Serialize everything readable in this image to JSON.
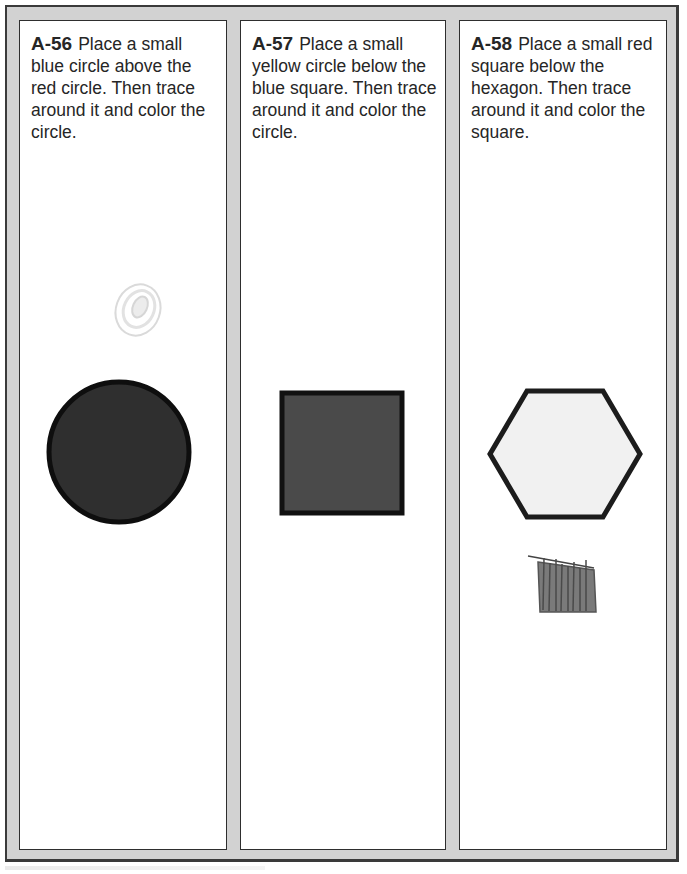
{
  "worksheet": {
    "panels": [
      {
        "id": "A-56",
        "instruction": "Place a small blue circle above the red circle.  Then trace around it and color the circle.",
        "printed_shape": "circle",
        "printed_shape_fill": "#2f2f2f",
        "drawn_shape": "small scribbled circle (very faint)",
        "drawn_shape_color": "#d8d8d8"
      },
      {
        "id": "A-57",
        "instruction": "Place a small yellow circle below the blue square.  Then trace around it and color the circle.",
        "printed_shape": "square",
        "printed_shape_fill": "#4a4a4a",
        "drawn_shape": "none"
      },
      {
        "id": "A-58",
        "instruction": "Place a small red square below the hexagon.  Then trace around it and color the square.",
        "printed_shape": "hexagon",
        "printed_shape_fill": "#f1f1f1",
        "drawn_shape": "small scribbled square",
        "drawn_shape_color": "#6a6a6a"
      }
    ],
    "colors": {
      "frame": "#d2d2d2",
      "border": "#2e2e2e",
      "text": "#262626"
    }
  }
}
